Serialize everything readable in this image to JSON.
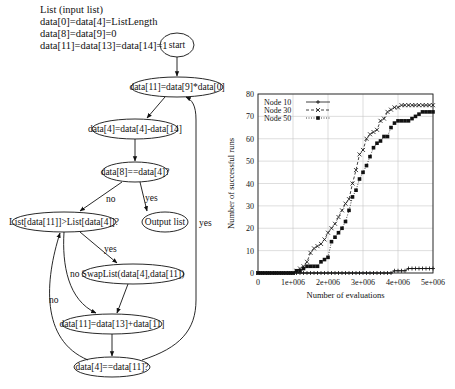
{
  "flowchart": {
    "init_lines": [
      "List (input list)",
      "data[0]=data[4]=ListLength",
      "data[8]=data[9]=0",
      "data[11]=data[13]=data[14]=1"
    ],
    "nodes": {
      "start": "start",
      "n1": "data[11]=data[9]*data[0]",
      "n2": "data[4]=data[4]-data[14]",
      "n3": "data[8]==data[4]?",
      "n4": "List[data[11]]>List[data[4]]?",
      "n5": "Output list",
      "n6": "SwapList(data[4],data[11])",
      "n7": "data[11]=data[13]+data[11]",
      "n8": "data[4]==data[11]?"
    },
    "edge_labels": {
      "n3_no": "no",
      "n3_yes": "yes",
      "n4_yes": "yes",
      "n4_no": "no",
      "n8_no": "no",
      "n8_yes": "yes"
    }
  },
  "chart_data": {
    "type": "line",
    "title": "",
    "xlabel": "Number of evaluations",
    "ylabel": "Number of successful runs",
    "xlim": [
      0,
      5000000
    ],
    "ylim": [
      0,
      80
    ],
    "x_ticks": [
      "0",
      "1e+006",
      "2e+006",
      "3e+006",
      "4e+006",
      "5e+006"
    ],
    "y_ticks": [
      "0",
      "10",
      "20",
      "30",
      "40",
      "50",
      "60",
      "70",
      "80"
    ],
    "grid": true,
    "legend_position": "top-left",
    "x": [
      0,
      100000,
      200000,
      300000,
      400000,
      500000,
      600000,
      700000,
      800000,
      900000,
      1000000,
      1100000,
      1200000,
      1300000,
      1400000,
      1500000,
      1600000,
      1700000,
      1800000,
      1900000,
      2000000,
      2100000,
      2200000,
      2300000,
      2400000,
      2500000,
      2600000,
      2700000,
      2800000,
      2900000,
      3000000,
      3100000,
      3200000,
      3300000,
      3400000,
      3500000,
      3600000,
      3700000,
      3800000,
      3900000,
      4000000,
      4100000,
      4200000,
      4300000,
      4400000,
      4500000,
      4600000,
      4700000,
      4800000,
      4900000,
      5000000
    ],
    "series": [
      {
        "name": "Node 10",
        "marker": "plus",
        "style": "solid",
        "values": [
          0,
          0,
          0,
          0,
          0,
          0,
          0,
          0,
          0,
          0,
          0,
          0,
          0,
          0,
          0,
          0,
          0,
          0,
          0,
          0,
          0,
          0,
          0,
          0,
          0,
          0,
          0,
          0,
          0,
          0,
          0,
          0,
          0,
          0,
          0,
          0,
          0,
          0,
          0,
          1,
          1,
          1,
          1,
          2,
          2,
          2,
          2,
          2,
          2,
          2,
          2
        ]
      },
      {
        "name": "Node 30",
        "marker": "x",
        "style": "dashed",
        "values": [
          0,
          0,
          0,
          0,
          0,
          0,
          0,
          0,
          0,
          0,
          0,
          1,
          2,
          3,
          5,
          9,
          11,
          12,
          13,
          15,
          18,
          20,
          22,
          25,
          28,
          31,
          33,
          40,
          46,
          53,
          55,
          60,
          62,
          63,
          64,
          68,
          69,
          72,
          73,
          74,
          74,
          75,
          75,
          75,
          75,
          75,
          75,
          75,
          75,
          75,
          75
        ]
      },
      {
        "name": "Node 50",
        "marker": "square",
        "style": "dotted",
        "values": [
          0,
          0,
          0,
          0,
          0,
          0,
          0,
          0,
          0,
          0,
          0,
          1,
          1,
          2,
          3,
          3,
          3,
          3,
          5,
          6,
          7,
          14,
          16,
          18,
          20,
          23,
          28,
          34,
          37,
          42,
          45,
          48,
          52,
          56,
          58,
          59,
          61,
          61,
          65,
          67,
          68,
          68,
          68,
          68,
          69,
          70,
          71,
          72,
          72,
          72,
          72
        ]
      }
    ],
    "colors": {
      "axis": "#222222",
      "grid": "#c8c8c8",
      "line": "#111111"
    }
  }
}
